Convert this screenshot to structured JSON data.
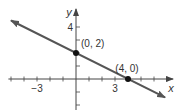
{
  "chart_data": {
    "type": "line",
    "title": "",
    "xlabel": "x",
    "ylabel": "y",
    "equation": "y = 2 - x/2",
    "xlim": [
      -5.2,
      7.3
    ],
    "ylim": [
      -2.4,
      5.2
    ],
    "x_ticks": [
      -5,
      -4,
      -3,
      -2,
      -1,
      1,
      2,
      3,
      4,
      5,
      6,
      7
    ],
    "y_ticks": [
      -2,
      -1,
      1,
      2,
      3,
      4
    ],
    "x_tick_labels": [
      {
        "value": -3,
        "label": "−3"
      },
      {
        "value": 3,
        "label": "3"
      }
    ],
    "y_tick_labels": [
      {
        "value": 4,
        "label": "4"
      }
    ],
    "grid": false,
    "series": [
      {
        "name": "line",
        "x": [
          -5,
          6.85
        ],
        "y": [
          4.5,
          -1.42
        ],
        "color": "#555555",
        "arrows": "both"
      }
    ],
    "points": [
      {
        "x": 0,
        "y": 2,
        "label": "(0, 2)"
      },
      {
        "x": 4,
        "y": 0,
        "label": "(4, 0)"
      }
    ]
  },
  "colors": {
    "line": "#555555",
    "axis": "#444444",
    "point": "#111111",
    "text": "#333333"
  }
}
